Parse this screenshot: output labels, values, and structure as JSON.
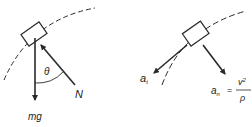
{
  "diagrams": {
    "left": {
      "title": "forces",
      "force_down_label": "mg",
      "normal_force_label": "N",
      "angle_label": "θ"
    },
    "right": {
      "title": "accelerations",
      "tangential_label_base": "a",
      "tangential_label_sub": "t",
      "normal_label_base": "a",
      "normal_label_sub": "n",
      "equals": "=",
      "numerator_base": "v",
      "numerator_sup": "2",
      "denominator": "ρ"
    }
  },
  "colors": {
    "stroke": "#2a2a2a",
    "background": "#ffffff"
  }
}
